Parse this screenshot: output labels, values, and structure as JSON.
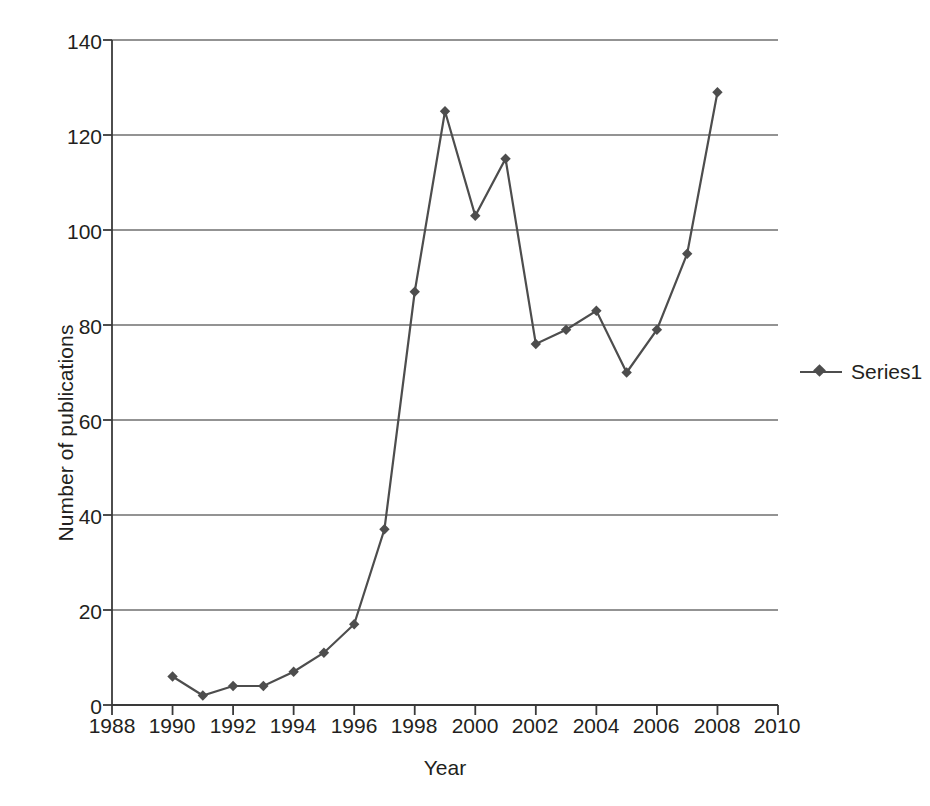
{
  "chart_data": {
    "type": "line",
    "title": "",
    "xlabel": "Year",
    "ylabel": "Number of publications",
    "xlim": [
      1988,
      2010
    ],
    "ylim": [
      0,
      140
    ],
    "xtick_step": 2,
    "ytick_step": 20,
    "grid": "horizontal",
    "legend_position": "right",
    "xticklabels": [
      "1988",
      "1990",
      "1992",
      "1994",
      "1996",
      "1998",
      "2000",
      "2002",
      "2004",
      "2006",
      "2008",
      "2010"
    ],
    "yticklabels": [
      "0",
      "20",
      "40",
      "60",
      "80",
      "100",
      "120",
      "140"
    ],
    "series": [
      {
        "name": "Series1",
        "color": "#4d4d4d",
        "marker": "diamond",
        "x": [
          1990,
          1991,
          1992,
          1993,
          1994,
          1995,
          1996,
          1997,
          1998,
          1999,
          2000,
          2001,
          2002,
          2003,
          2004,
          2005,
          2006,
          2007,
          2008
        ],
        "values": [
          6,
          2,
          4,
          4,
          7,
          11,
          17,
          37,
          87,
          125,
          103,
          115,
          76,
          79,
          83,
          70,
          79,
          95,
          129
        ]
      }
    ]
  },
  "legend": {
    "entries": [
      {
        "label": "Series1",
        "marker_icon": "line-diamond-marker-icon"
      }
    ]
  },
  "colors": {
    "series": "#4d4d4d",
    "grid": "#6f6f6f",
    "axis": "#3a3a3a",
    "text": "#231f20",
    "background": "#ffffff"
  }
}
